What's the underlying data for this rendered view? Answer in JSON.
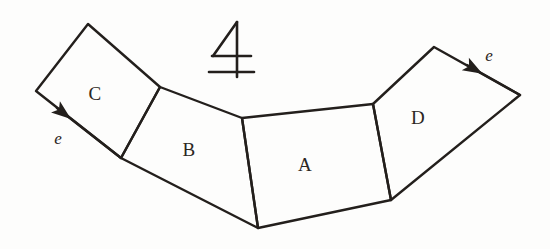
{
  "figure": {
    "background_color": "#fdfdfc",
    "stroke_color": "#231f1c",
    "width": 550,
    "height": 249
  },
  "faces": [
    {
      "id": "C",
      "label": "C",
      "label_x": 95,
      "label_y": 94,
      "points": "88,24 160,87 121,158 36,91"
    },
    {
      "id": "B",
      "label": "B",
      "label_x": 189,
      "label_y": 150,
      "points": "160,87 242,118 258,228 121,158"
    },
    {
      "id": "A",
      "label": "A",
      "label_x": 305,
      "label_y": 165,
      "points": "242,118 373,104 391,200 258,228"
    },
    {
      "id": "D",
      "label": "D",
      "label_x": 418,
      "label_y": 118,
      "points": "373,104 434,47 520,95 391,200"
    }
  ],
  "edge_arrows": [
    {
      "id": "left-e",
      "label": "e",
      "label_x": 58,
      "label_y": 139,
      "shaft": "121,158 36,91",
      "tip_x": 57,
      "tip_y": 108
    },
    {
      "id": "right-e",
      "label": "e",
      "label_x": 489,
      "label_y": 56,
      "shaft": "520,95 434,47",
      "tip_x": 467,
      "tip_y": 65
    }
  ],
  "count_mark": {
    "name": "four-with-bar-symbol",
    "text": "4",
    "x": 231,
    "y": 48,
    "strokes": {
      "diagonal": "237,22 213,56",
      "vertical": "237,22 237,77",
      "upper_bar": "212,56 251,56",
      "lower_bar": "209,72 254,72"
    }
  }
}
